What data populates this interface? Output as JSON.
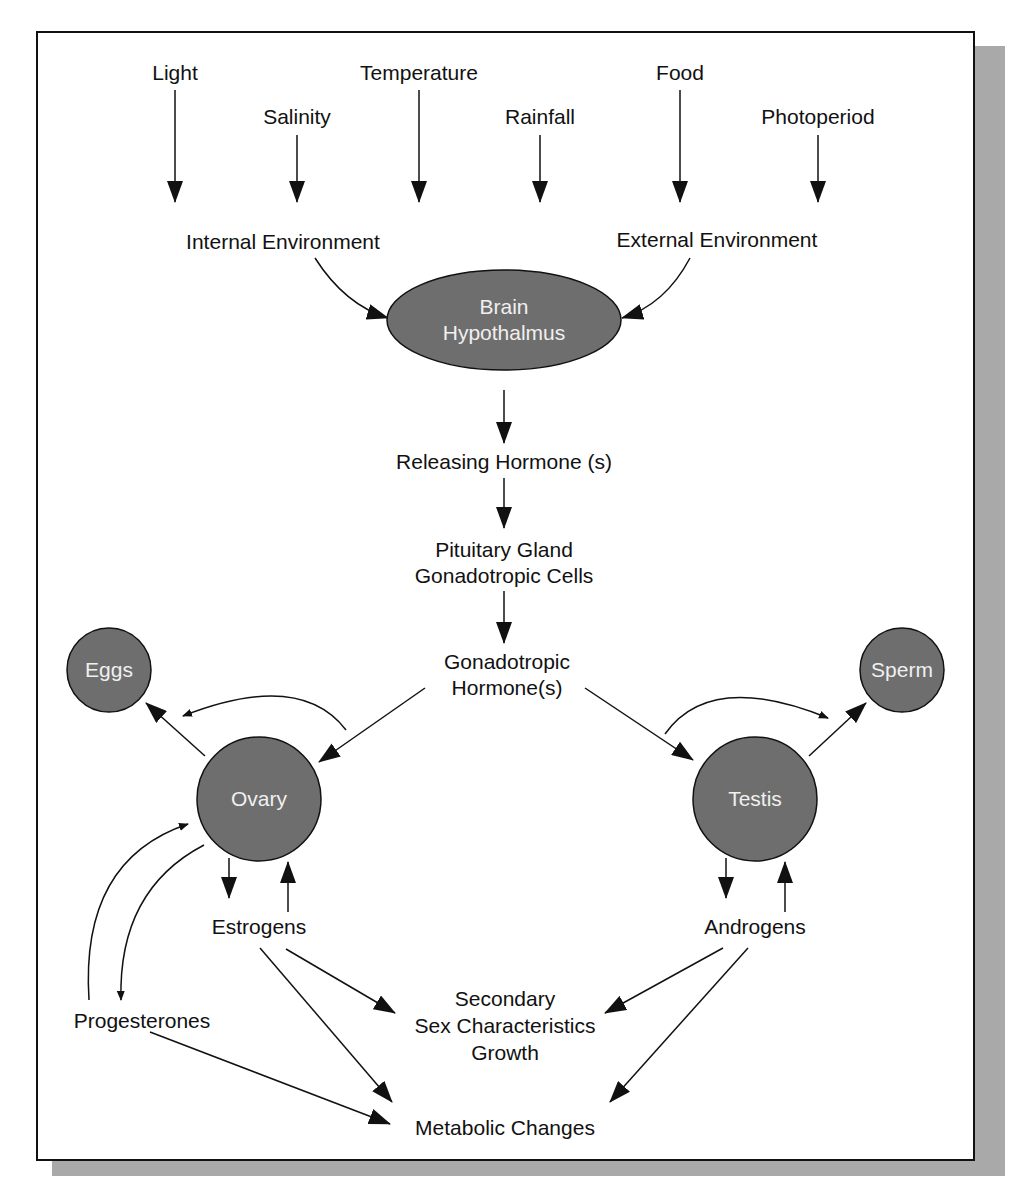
{
  "diagram": {
    "inputs": {
      "light": "Light",
      "salinity": "Salinity",
      "temperature": "Temperature",
      "rainfall": "Rainfall",
      "food": "Food",
      "photoperiod": "Photoperiod"
    },
    "environment": {
      "internal": "Internal Environment",
      "external": "External Environment"
    },
    "brain": {
      "line1": "Brain",
      "line2": "Hypothalmus"
    },
    "releasing_hormone": "Releasing Hormone (s)",
    "pituitary": {
      "line1": "Pituitary Gland",
      "line2": "Gonadotropic Cells"
    },
    "gonadotropic_hormone": {
      "line1": "Gonadotropic",
      "line2": "Hormone(s)"
    },
    "eggs": "Eggs",
    "sperm": "Sperm",
    "ovary": "Ovary",
    "testis": "Testis",
    "estrogens": "Estrogens",
    "androgens": "Androgens",
    "progesterones": "Progesterones",
    "secondary": {
      "line1": "Secondary",
      "line2": "Sex Characteristics",
      "line3": "Growth"
    },
    "metabolic": "Metabolic Changes",
    "colors": {
      "node_fill": "#6e6e6e",
      "node_text": "#f0f0f0",
      "line": "#111111",
      "shadow": "#a9a9a9"
    }
  }
}
